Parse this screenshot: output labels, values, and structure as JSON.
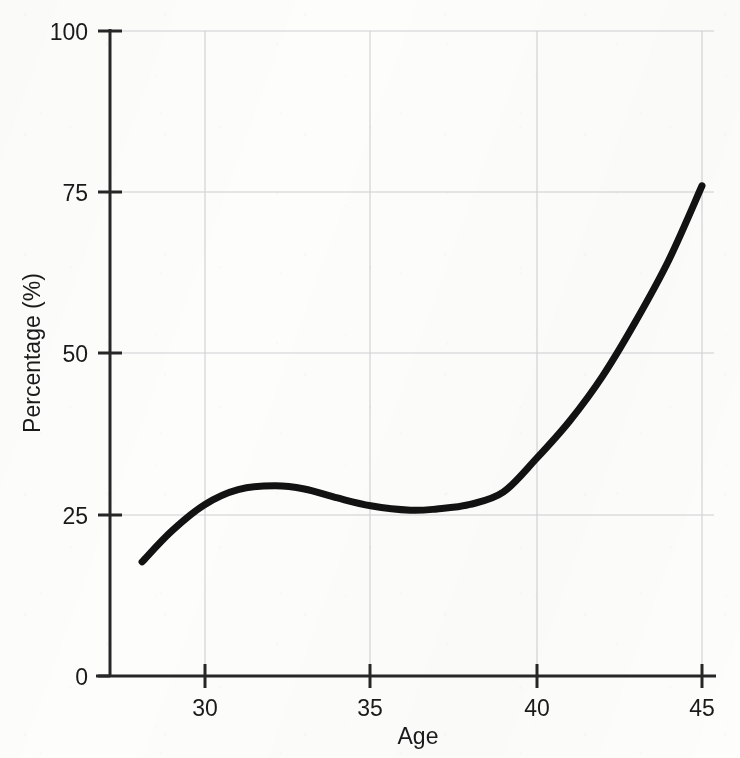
{
  "chart_data": {
    "type": "line",
    "title": "",
    "subtitle": "",
    "xlabel": "Age",
    "ylabel": "Percentage (%)",
    "xlim": [
      28,
      45
    ],
    "ylim": [
      0,
      100
    ],
    "xticks": [
      30,
      35,
      40,
      45
    ],
    "xtick_labels": [
      "30",
      "35",
      "40",
      "45"
    ],
    "yticks": [
      0,
      25,
      50,
      75,
      100
    ],
    "ytick_labels": [
      "0",
      "25",
      "50",
      "75",
      "100"
    ],
    "grid": true,
    "grid_color": "#cfcfcf",
    "legend": "none",
    "line_color": "#121212",
    "line_width_px": 7,
    "series": [
      {
        "name": "Percentage",
        "x": [
          28.1,
          29.0,
          30.0,
          31.0,
          32.1,
          33.0,
          34.0,
          35.0,
          36.2,
          37.0,
          38.0,
          39.0,
          40.0,
          41.0,
          42.0,
          43.0,
          44.0,
          45.0
        ],
        "values": [
          17.7,
          22.5,
          26.6,
          28.9,
          29.5,
          29.0,
          27.6,
          26.4,
          25.7,
          25.9,
          26.6,
          28.5,
          33.7,
          39.5,
          46.5,
          55.0,
          64.5,
          76.0
        ]
      }
    ],
    "annotations": []
  },
  "axes": {
    "x_axis_name": "x-axis",
    "y_axis_name": "y-axis"
  }
}
